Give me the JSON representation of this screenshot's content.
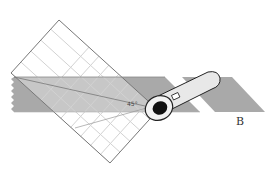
{
  "diagram": {
    "labels": {
      "fabric_b": "B",
      "angle": "45°"
    },
    "colors": {
      "fabric": "#a8a8a8",
      "fabric_dark": "#9a9a9a",
      "ruler_grid": "#d6d6d6",
      "ruler_edge": "#777777",
      "cutter_handle": "#e8e8e8",
      "cutter_blade": "#111111"
    }
  }
}
